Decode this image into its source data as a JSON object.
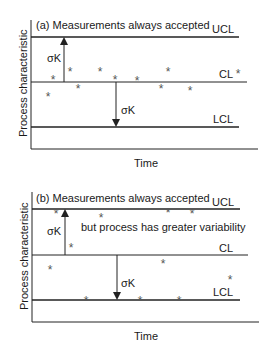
{
  "panels": [
    {
      "id": "a",
      "title": "(a) Measurements always accepted",
      "ucl_label": "UCL",
      "cl_label": "CL",
      "lcl_label": "LCL",
      "sigma_up": "σK",
      "sigma_down": "σK",
      "xlabel": "Time",
      "ylabel": "Process characteristic",
      "legend_marker": "*"
    },
    {
      "id": "b",
      "title": "(b) Measurements always accepted",
      "subtitle": "but process has greater variability",
      "ucl_label": "UCL",
      "cl_label": "CL",
      "lcl_label": "LCL",
      "sigma_up": "σK",
      "sigma_down": "σK",
      "xlabel": "Time",
      "ylabel": "Process characteristic"
    }
  ],
  "marker": "*"
}
